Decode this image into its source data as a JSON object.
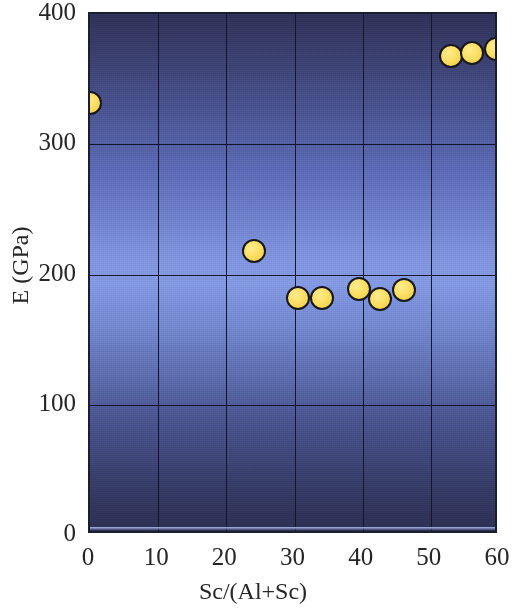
{
  "chart_data": {
    "type": "scatter",
    "title": "",
    "xlabel": "Sc/(Al+Sc)",
    "ylabel": "E (GPa)",
    "xlim": [
      0,
      60
    ],
    "ylim": [
      0,
      400
    ],
    "xticks": [
      0,
      10,
      20,
      30,
      40,
      50,
      60
    ],
    "yticks": [
      0,
      100,
      200,
      300,
      400
    ],
    "xtick_labels": [
      "0",
      "10",
      "20",
      "30",
      "40",
      "50",
      "60"
    ],
    "ytick_labels": [
      "0",
      "100",
      "200",
      "300",
      "400"
    ],
    "grid": true,
    "legend": "none",
    "series": [
      {
        "name": "E",
        "marker": "filled-circle",
        "marker_color": "#f7db5e",
        "marker_edge_color": "#17171c",
        "points": [
          {
            "x": 0.0,
            "y": 332
          },
          {
            "x": 24.0,
            "y": 218
          },
          {
            "x": 30.5,
            "y": 182
          },
          {
            "x": 34.0,
            "y": 182
          },
          {
            "x": 39.5,
            "y": 189
          },
          {
            "x": 42.5,
            "y": 181
          },
          {
            "x": 46.0,
            "y": 188
          },
          {
            "x": 53.0,
            "y": 368
          },
          {
            "x": 56.0,
            "y": 370
          },
          {
            "x": 59.5,
            "y": 373
          }
        ]
      }
    ],
    "background": {
      "type": "vertical-gradient",
      "top_color": "#2e3157",
      "middle_color": "#8298e2",
      "bottom_color": "#2c2f52"
    },
    "axis_color": "#1b1d33",
    "gridline_color": "#13152b",
    "text_color": "#262626"
  }
}
